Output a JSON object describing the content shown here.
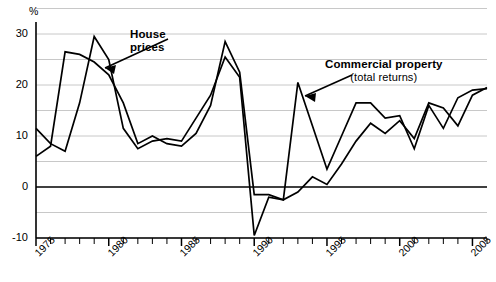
{
  "chart_data": {
    "type": "line",
    "title": "",
    "subtitle": "",
    "xlabel": "",
    "ylabel": "%",
    "axis_unit_label": "%",
    "grid": true,
    "grid_step": 5,
    "legend_position": "inline-annotations",
    "xlim": [
      1975,
      2006
    ],
    "ylim": [
      -10,
      35
    ],
    "yticks": [
      30,
      20,
      10,
      0,
      -10
    ],
    "ytick_labels": [
      "30",
      "20",
      "10",
      "0",
      "-10"
    ],
    "gridlines": [
      35,
      30,
      25,
      20,
      15,
      10,
      5,
      0,
      -5,
      -10
    ],
    "zero_line": 0,
    "xticks": [
      1975,
      1976,
      1977,
      1978,
      1979,
      1980,
      1981,
      1982,
      1983,
      1984,
      1985,
      1986,
      1987,
      1988,
      1989,
      1990,
      1991,
      1992,
      1993,
      1994,
      1995,
      1996,
      1997,
      1998,
      1999,
      2000,
      2001,
      2002,
      2003,
      2004,
      2005,
      2006
    ],
    "xtick_labels": [
      "1975",
      "1980",
      "1985",
      "1990",
      "1995",
      "2000",
      "2005"
    ],
    "xtick_label_years": [
      1975,
      1980,
      1985,
      1990,
      1995,
      2000,
      2005
    ],
    "x": [
      1975,
      1976,
      1977,
      1978,
      1979,
      1980,
      1981,
      1982,
      1983,
      1984,
      1985,
      1986,
      1987,
      1988,
      1989,
      1990,
      1991,
      1992,
      1993,
      1994,
      1995,
      1996,
      1997,
      1998,
      1999,
      2000,
      2001,
      2002,
      2003,
      2004,
      2005,
      2006
    ],
    "series": [
      {
        "name": "House prices",
        "annotation": "House prices",
        "color": "#000000",
        "values": [
          11.5,
          8.5,
          7.0,
          16.5,
          29.5,
          25.0,
          11.5,
          7.5,
          9.0,
          9.5,
          9.0,
          13.5,
          18.0,
          25.5,
          21.5,
          -9.5,
          -2.0,
          -2.5,
          -1.0,
          2.0,
          0.5,
          4.5,
          9.0,
          12.5,
          10.5,
          13.0,
          9.5,
          16.5,
          15.5,
          12.0,
          18.0,
          19.5
        ]
      },
      {
        "name": "Commercial property (total returns)",
        "annotation": "Commercial property",
        "annotation_sub": "(total returns)",
        "color": "#000000",
        "values": [
          6.0,
          8.0,
          26.5,
          26.0,
          24.5,
          22.0,
          16.5,
          8.5,
          10.0,
          8.5,
          8.0,
          10.5,
          16.0,
          28.5,
          22.5,
          -1.5,
          -1.5,
          -2.5,
          20.5,
          12.0,
          3.5,
          10.0,
          16.5,
          16.5,
          13.5,
          14.0,
          7.5,
          16.0,
          11.5,
          17.5,
          19.0,
          19.3
        ]
      }
    ]
  },
  "annotations": {
    "house": {
      "line1": "House",
      "line2": "prices"
    },
    "commercial": {
      "line1": "Commercial property",
      "line2": "(total returns)"
    }
  },
  "axis": {
    "unit": "%",
    "y_labels": [
      "30",
      "20",
      "10",
      "0",
      "-10"
    ],
    "x_labels": [
      "1975",
      "1980",
      "1985",
      "1990",
      "1995",
      "2000",
      "2005"
    ]
  },
  "colors": {
    "series_line": "#000000",
    "grid": "#c8c8c8",
    "axis": "#000000",
    "zero_line": "#000000",
    "background": "#ffffff"
  }
}
